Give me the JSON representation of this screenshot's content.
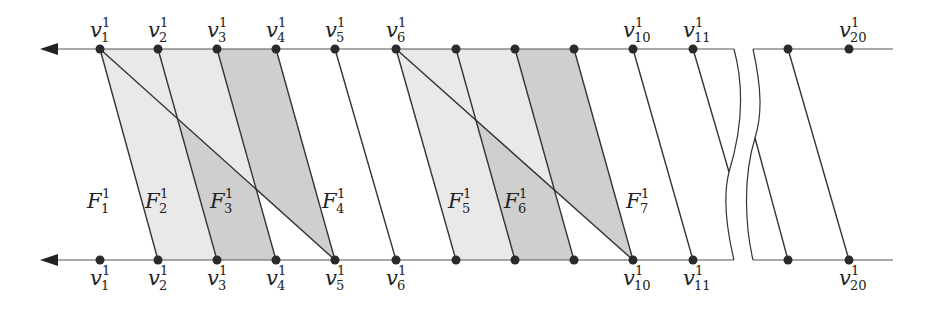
{
  "diagram": {
    "type": "fan / face decomposition between two parallel lines",
    "colors": {
      "line": "#333333",
      "vertex": "#2a2a2a",
      "light_fill": "#e9e9e9",
      "dark_fill": "#cfcfcf",
      "background": "#ffffff"
    },
    "top_line": {
      "y": 49,
      "arrow": "left",
      "vertices": [
        {
          "x": 100,
          "label": "v",
          "sub": "1",
          "sup": "1"
        },
        {
          "x": 158,
          "label": "v",
          "sub": "2",
          "sup": "1"
        },
        {
          "x": 217,
          "label": "v",
          "sub": "3",
          "sup": "1"
        },
        {
          "x": 276,
          "label": "v",
          "sub": "4",
          "sup": "1"
        },
        {
          "x": 335,
          "label": "v",
          "sub": "5",
          "sup": "1"
        },
        {
          "x": 396,
          "label": "v",
          "sub": "6",
          "sup": "1"
        },
        {
          "x": 456,
          "label": "",
          "sub": "",
          "sup": ""
        },
        {
          "x": 515,
          "label": "",
          "sub": "",
          "sup": ""
        },
        {
          "x": 574,
          "label": "",
          "sub": "",
          "sup": ""
        },
        {
          "x": 633,
          "label": "v",
          "sub": "10",
          "sup": "1"
        },
        {
          "x": 693,
          "label": "v",
          "sub": "11",
          "sup": "1"
        },
        {
          "x": 788,
          "label": "",
          "sub": "",
          "sup": ""
        },
        {
          "x": 849,
          "label": "v",
          "sub": "20",
          "sup": "1"
        }
      ]
    },
    "bottom_line": {
      "y": 260,
      "arrow": "left",
      "vertices": [
        {
          "x": 100,
          "label": "v",
          "sub": "1",
          "sup": "1"
        },
        {
          "x": 158,
          "label": "v",
          "sub": "2",
          "sup": "1"
        },
        {
          "x": 217,
          "label": "v",
          "sub": "3",
          "sup": "1"
        },
        {
          "x": 276,
          "label": "v",
          "sub": "4",
          "sup": "1"
        },
        {
          "x": 335,
          "label": "v",
          "sub": "5",
          "sup": "1"
        },
        {
          "x": 396,
          "label": "v",
          "sub": "6",
          "sup": "1"
        },
        {
          "x": 456,
          "label": "",
          "sub": "",
          "sup": ""
        },
        {
          "x": 515,
          "label": "",
          "sub": "",
          "sup": ""
        },
        {
          "x": 574,
          "label": "",
          "sub": "",
          "sup": ""
        },
        {
          "x": 633,
          "label": "v",
          "sub": "10",
          "sup": "1"
        },
        {
          "x": 693,
          "label": "v",
          "sub": "11",
          "sup": "1"
        },
        {
          "x": 788,
          "label": "",
          "sub": "",
          "sup": ""
        },
        {
          "x": 849,
          "label": "v",
          "sub": "20",
          "sup": "1"
        }
      ]
    },
    "faces": [
      {
        "label": "F",
        "sub": "1",
        "sup": "1",
        "x": 97,
        "y": 208
      },
      {
        "label": "F",
        "sub": "2",
        "sup": "1",
        "x": 155,
        "y": 208
      },
      {
        "label": "F",
        "sub": "3",
        "sup": "1",
        "x": 220,
        "y": 208
      },
      {
        "label": "F",
        "sub": "4",
        "sup": "1",
        "x": 332,
        "y": 208
      },
      {
        "label": "F",
        "sub": "5",
        "sup": "1",
        "x": 458,
        "y": 208
      },
      {
        "label": "F",
        "sub": "6",
        "sup": "1",
        "x": 514,
        "y": 208
      },
      {
        "label": "F",
        "sub": "7",
        "sup": "1",
        "x": 636,
        "y": 208
      }
    ]
  }
}
